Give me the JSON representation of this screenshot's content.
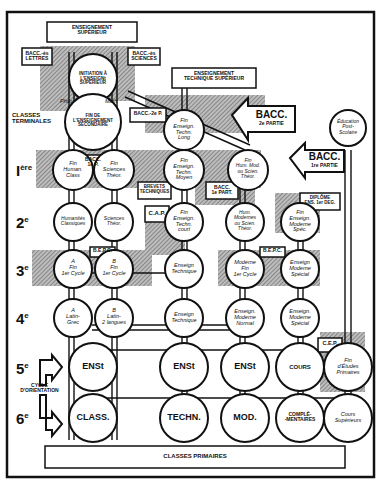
{
  "diagram": {
    "type": "education-system-flowchart",
    "top_boxes": {
      "enseignement_superieur": [
        "ENSEIGNEMENT",
        "SUPÉRIEUR"
      ],
      "enseignement_technique_superieur": [
        "ENSEIGNEMENT",
        "TECHNIQUE SUPÉRIEUR"
      ],
      "bacc_lettres": [
        "BACC.-ès",
        "LETTRES"
      ],
      "bacc_sciences": [
        "BACC.-ès",
        "SCIENCES"
      ],
      "bacc_2e_p": "BACC.-2e P.",
      "bacc_1e_p_inner": [
        "BACC.",
        "1e P."
      ],
      "bacc_1e_part": [
        "BACC.",
        "1e PART."
      ],
      "brevets_techniques": [
        "BREVETS",
        "TECHNIQUES"
      ],
      "cap": "C.A.P.",
      "diplome": [
        "DIPLÔME",
        "ENS. 1er DEG."
      ],
      "bepc_left": "B.E.P.C.",
      "bepc_right": "B.E.P.C.",
      "cep": "C.E.P.",
      "classes_primaires": "CLASSES PRIMAIRES"
    },
    "big_arrows": {
      "bacc_2e": [
        "BACC.",
        "2e PARTIE"
      ],
      "bacc_1e": [
        "BACC.",
        "1re PARTIE"
      ]
    },
    "side_labels": {
      "classes_terminales": [
        "CLASSES",
        "TERMINALES"
      ],
      "cycle_orientation": [
        "CYCLE",
        "D'ORIENTATION"
      ],
      "philo": "Philo",
      "math": "Math"
    },
    "levels": [
      {
        "id": "1ere",
        "label": "I",
        "sup": "ère"
      },
      {
        "id": "2e",
        "label": "2",
        "sup": "e"
      },
      {
        "id": "3e",
        "label": "3",
        "sup": "e"
      },
      {
        "id": "4e",
        "label": "4",
        "sup": "e"
      },
      {
        "id": "5e",
        "label": "5",
        "sup": "e"
      },
      {
        "id": "6e",
        "label": "6",
        "sup": "e"
      }
    ],
    "nodes": {
      "initiation": [
        "INITIATION À",
        "L'ENSEIGNt SUPÉRIEUR"
      ],
      "fin_secondaire": [
        "FIN DE",
        "L'ENSEIGNEMENT",
        "SECONDAIRE"
      ],
      "fin_tech_long": [
        "Fin",
        "Enseign.",
        "Techn.",
        "Long"
      ],
      "education_post_scolaire": [
        "Éducation",
        "Post-",
        "Scolaire"
      ],
      "fin_human_class": [
        "Fin",
        "Human.",
        "Class"
      ],
      "fin_sciences_theor": [
        "Fin",
        "Sciences",
        "Théor."
      ],
      "fin_tech_moyen": [
        "Fin",
        "Enseign.",
        "Techn.",
        "Moyen"
      ],
      "fin_hum_mod": [
        "Fin",
        "Hum. Mod.",
        "ou Scien.",
        "Théor."
      ],
      "humanites_classiques": [
        "Humanités",
        "Classiques"
      ],
      "sciences_theor": [
        "Sciences",
        "Théor."
      ],
      "fin_tech_court": [
        "Fin",
        "Enseign.",
        "Techn.",
        "court"
      ],
      "hum_modernes": [
        "Hum.",
        "Modernes",
        "ou Scien.",
        "Théor."
      ],
      "fin_ens_moderne_spec": [
        "Fin",
        "Enseign.",
        "Moderne",
        "Spéc."
      ],
      "fin_1er_cycle_a": [
        "A",
        "Fin",
        "1er Cycle"
      ],
      "fin_1er_cycle_b": [
        "B",
        "Fin",
        "1er Cycle"
      ],
      "enseign_technique_3": [
        "Enseign",
        "Technique"
      ],
      "moderne_fin_1er_cycle": [
        "Moderne",
        "Fin",
        "1er Cycle"
      ],
      "enseign_moderne_special_3": [
        "Enseign",
        "Moderne",
        "Spécial"
      ],
      "latin_grec": [
        "A",
        "Latin-",
        "Grec"
      ],
      "latin_2_langues": [
        "B",
        "Latin-",
        "2 langues"
      ],
      "enseign_technique_4": [
        "Enseign",
        "Technique"
      ],
      "enseign_moderne_normal": [
        "Enseign.",
        "Moderne",
        "Normal"
      ],
      "enseign_moderne_special_4": [
        "Enseign.",
        "Moderne",
        "Spécial"
      ],
      "ens_1": "ENSt",
      "ens_2": "ENSt",
      "ens_3": "ENSt",
      "cours": "COURS",
      "fin_etudes_primaires": [
        "Fin",
        "d'Études",
        "Primaires"
      ],
      "class": "CLASS.",
      "techn": "TECHN.",
      "mod": "MOD.",
      "complementaires": [
        "COMPLÉ-",
        "-MENTAIRES"
      ],
      "cours_superieurs": [
        "Cours",
        "Supérieurs"
      ]
    },
    "colors": {
      "ink": "#111111",
      "hatch": "#8a8a8a",
      "paper": "#ffffff"
    }
  }
}
